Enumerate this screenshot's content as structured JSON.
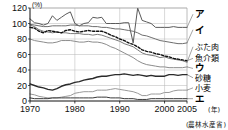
{
  "chart_data": {
    "type": "line",
    "title": "",
    "xlabel": "年",
    "ylabel": "",
    "unit": "(%)",
    "source": "(農林水産省)",
    "grid": true,
    "legend_position": "right-inline",
    "xlim": [
      1970,
      2005
    ],
    "ylim": [
      0,
      120
    ],
    "yticks": [
      0,
      20,
      40,
      60,
      80,
      100,
      120
    ],
    "xticks": [
      1970,
      1980,
      1990,
      2000,
      2005
    ],
    "xtick_labels": [
      "1970",
      "1980",
      "1990",
      "2000",
      "2005"
    ],
    "x": [
      1970,
      1971,
      1972,
      1973,
      1974,
      1975,
      1976,
      1977,
      1978,
      1979,
      1980,
      1981,
      1982,
      1983,
      1984,
      1985,
      1986,
      1987,
      1988,
      1989,
      1990,
      1991,
      1992,
      1993,
      1994,
      1995,
      1996,
      1997,
      1998,
      1999,
      2000,
      2001,
      2002,
      2003,
      2004,
      2005
    ],
    "series": [
      {
        "name": "ア",
        "label": "ア",
        "color": "#5a5a5a",
        "width": 1.0,
        "dash": "none",
        "values": [
          106,
          101,
          100,
          98,
          100,
          110,
          104,
          108,
          112,
          115,
          100,
          97,
          100,
          101,
          108,
          107,
          108,
          100,
          100,
          100,
          100,
          101,
          101,
          75,
          120,
          104,
          102,
          100,
          95,
          95,
          95,
          95,
          96,
          95,
          95,
          95
        ]
      },
      {
        "name": "イ",
        "label": "イ",
        "color": "#6e6e6e",
        "width": 1.0,
        "dash": "none",
        "values": [
          99,
          98,
          97,
          96,
          96,
          97,
          97,
          97,
          97,
          98,
          98,
          97,
          97,
          97,
          96,
          96,
          95,
          95,
          94,
          93,
          93,
          92,
          91,
          90,
          88,
          85,
          84,
          82,
          80,
          78,
          77,
          76,
          75,
          74,
          74,
          75
        ]
      },
      {
        "name": "ぶた肉",
        "label": "ぶた肉",
        "color": "#7a7a7a",
        "width": 1.0,
        "dash": "none",
        "values": [
          98,
          96,
          92,
          90,
          89,
          88,
          89,
          88,
          88,
          87,
          87,
          87,
          86,
          86,
          85,
          86,
          85,
          83,
          81,
          79,
          77,
          74,
          72,
          70,
          66,
          62,
          60,
          59,
          58,
          56,
          57,
          55,
          54,
          53,
          52,
          50
        ]
      },
      {
        "name": "魚介類",
        "label": "魚介類",
        "color": "#111111",
        "width": 1.4,
        "dash": "dashed",
        "values": [
          95,
          94,
          90,
          88,
          91,
          90,
          89,
          88,
          91,
          92,
          90,
          89,
          90,
          91,
          90,
          90,
          90,
          88,
          85,
          83,
          80,
          78,
          75,
          73,
          70,
          66,
          64,
          63,
          61,
          60,
          58,
          57,
          55,
          54,
          53,
          52
        ]
      },
      {
        "name": "ウ",
        "label": "ウ",
        "color": "#8c8c8c",
        "width": 1.0,
        "dash": "none",
        "values": [
          80,
          78,
          77,
          76,
          75,
          75,
          76,
          78,
          78,
          78,
          77,
          76,
          76,
          77,
          76,
          76,
          75,
          73,
          70,
          68,
          65,
          62,
          59,
          56,
          52,
          49,
          47,
          46,
          45,
          44,
          44,
          43,
          43,
          43,
          43,
          44
        ]
      },
      {
        "name": "砂糖",
        "label": "砂糖",
        "color": "#2b2b2b",
        "width": 1.4,
        "dash": "none",
        "values": [
          22,
          20,
          18,
          17,
          15,
          14,
          16,
          19,
          21,
          22,
          24,
          25,
          27,
          28,
          29,
          31,
          32,
          32,
          33,
          34,
          34,
          35,
          34,
          33,
          34,
          33,
          32,
          33,
          32,
          32,
          32,
          34,
          34,
          33,
          34,
          34
        ]
      },
      {
        "name": "小麦",
        "label": "小麦",
        "color": "#9a9a9a",
        "width": 1.0,
        "dash": "none",
        "values": [
          9,
          8,
          6,
          5,
          4,
          4,
          4,
          5,
          6,
          7,
          10,
          11,
          12,
          12,
          12,
          14,
          14,
          14,
          15,
          16,
          15,
          14,
          13,
          12,
          10,
          7,
          7,
          9,
          9,
          9,
          11,
          11,
          13,
          14,
          14,
          14
        ]
      },
      {
        "name": "エ",
        "label": "エ",
        "color": "#3a3a3a",
        "width": 1.0,
        "dash": "none",
        "values": [
          4,
          3,
          3,
          3,
          3,
          4,
          4,
          4,
          4,
          4,
          4,
          4,
          4,
          4,
          4,
          5,
          5,
          5,
          4,
          4,
          4,
          3,
          3,
          3,
          2,
          2,
          2,
          3,
          3,
          3,
          3,
          3,
          3,
          3,
          3,
          3
        ]
      }
    ],
    "right_labels": [
      {
        "text": "ア",
        "kana": true,
        "y_value": 112
      },
      {
        "text": "イ",
        "kana": true,
        "y_value": 92
      },
      {
        "text": "ぶた肉",
        "kana": false,
        "y_value": 70
      },
      {
        "text": "魚介類",
        "kana": false,
        "y_value": 55
      },
      {
        "text": "ウ",
        "kana": true,
        "y_value": 42
      },
      {
        "text": "砂糖",
        "kana": false,
        "y_value": 30
      },
      {
        "text": "小麦",
        "kana": false,
        "y_value": 17
      },
      {
        "text": "エ",
        "kana": true,
        "y_value": 3
      }
    ]
  }
}
